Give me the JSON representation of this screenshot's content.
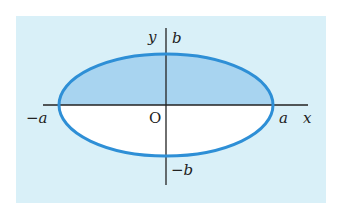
{
  "figure": {
    "colors": {
      "panel_background": "#d9f0f8",
      "upper_half_fill": "#a8d4f0",
      "lower_half_fill": "#ffffff",
      "ellipse_stroke": "#2e8fd6",
      "axis_color": "#222222",
      "label_color": "#222222"
    },
    "axes": {
      "x_label": "x",
      "y_label": "y",
      "origin_label": "O"
    },
    "intercepts": {
      "x_positive": "a",
      "x_negative": "−a",
      "y_positive": "b",
      "y_negative": "−b"
    },
    "shaded_region": "upper half of ellipse (y ≥ 0)"
  }
}
